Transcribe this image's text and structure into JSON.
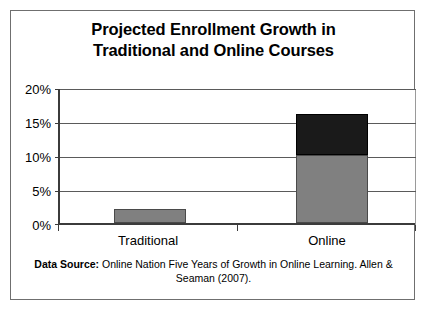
{
  "chart_data": {
    "type": "bar",
    "title": "Projected Enrollment Growth in Traditional and Online Courses",
    "title_lines": [
      "Projected Enrollment Growth in",
      "Traditional and Online Courses"
    ],
    "xlabel": "",
    "ylabel": "",
    "categories": [
      "Traditional",
      "Online"
    ],
    "ylim": [
      0,
      20
    ],
    "ytick_labels": [
      "0%",
      "5%",
      "10%",
      "15%",
      "20%"
    ],
    "ytick_values": [
      0,
      5,
      10,
      15,
      20
    ],
    "grid": true,
    "legend": "none",
    "stacked": true,
    "series": [
      {
        "name": "base-growth",
        "color": "#808080",
        "values": [
          2,
          10
        ]
      },
      {
        "name": "additional-growth",
        "color": "#1a1a1a",
        "values": [
          0,
          6
        ]
      }
    ],
    "totals": [
      2,
      16
    ],
    "annotations": {
      "source_label": "Data Source:",
      "source_text": " Online Nation Five Years of Growth in Online Learning. Allen & Seaman (2007)."
    }
  },
  "colors": {
    "bar_gray": "#808080",
    "bar_black": "#1a1a1a",
    "frame": "#6f6f6f",
    "axis": "#3b3b3b",
    "gridline": "#5a5a5a"
  }
}
